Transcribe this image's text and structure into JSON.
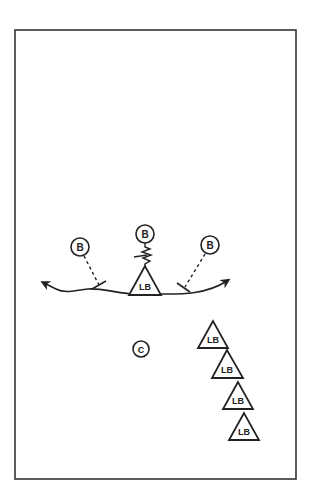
{
  "diagram": {
    "type": "football-drill",
    "field": {
      "x": 15,
      "y": 30,
      "width": 281,
      "height": 449,
      "stroke": "#333333"
    },
    "colors": {
      "ink": "#222222",
      "background": "#ffffff"
    },
    "players": {
      "blockers": [
        {
          "id": "b-left",
          "label": "B",
          "cx": 80,
          "cy": 247,
          "r": 9
        },
        {
          "id": "b-center",
          "label": "B",
          "cx": 145,
          "cy": 234,
          "r": 9
        },
        {
          "id": "b-right",
          "label": "B",
          "cx": 210,
          "cy": 245,
          "r": 9
        }
      ],
      "main_linebacker": {
        "id": "lb-main",
        "label": "LB",
        "apex_x": 145,
        "apex_y": 266,
        "base_left": 129,
        "base_right": 161,
        "base_y": 295
      },
      "coach": {
        "id": "coach",
        "label": "C",
        "cx": 141,
        "cy": 349,
        "r": 8
      },
      "waiting_linebackers": [
        {
          "id": "lb-1",
          "label": "LB",
          "apex_x": 213,
          "apex_y": 321,
          "base_left": 198,
          "base_right": 228,
          "base_y": 348
        },
        {
          "id": "lb-2",
          "label": "LB",
          "apex_x": 227,
          "apex_y": 350,
          "base_left": 212,
          "base_right": 243,
          "base_y": 378
        },
        {
          "id": "lb-3",
          "label": "LB",
          "apex_x": 238,
          "apex_y": 382,
          "base_left": 223,
          "base_right": 253,
          "base_y": 409
        },
        {
          "id": "lb-4",
          "label": "LB",
          "apex_x": 244,
          "apex_y": 413,
          "base_left": 229,
          "base_right": 259,
          "base_y": 440
        }
      ]
    },
    "paths": {
      "left_run": "M 131 294 C 112 292, 100 288, 88 289 C 76 290, 66 294, 56 289 L 44 283",
      "right_run": "M 160 294 C 180 294, 205 295, 227 281",
      "left_block_dash": {
        "x1": 85,
        "y1": 256,
        "x2": 99,
        "y2": 285
      },
      "right_block_dash": {
        "x1": 205,
        "y1": 254,
        "x2": 185,
        "y2": 287
      },
      "center_zigzag": "M 145 243 L 145 247 L 150 249 L 142 252 L 151 255 L 143 258 L 150 261 L 145 264 L 145 266"
    }
  }
}
